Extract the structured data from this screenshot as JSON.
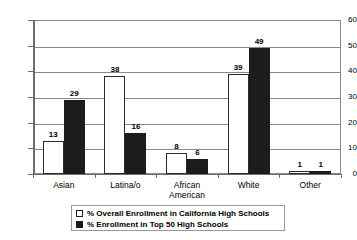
{
  "chart_data": {
    "type": "bar",
    "title": "",
    "subtitle": "",
    "xlabel": "",
    "ylabel": "",
    "ylim": [
      0,
      60
    ],
    "yticks": [
      0,
      10,
      20,
      30,
      40,
      50,
      60
    ],
    "grid": true,
    "legend_position": "bottom",
    "categories": [
      "Asian",
      "Latina/o",
      "African American",
      "White",
      "Other"
    ],
    "series": [
      {
        "name": "% Overall Enrollment in California High Schools",
        "color": "#ffffff",
        "edge_color": "#1c1c1c",
        "values": [
          13,
          38,
          8,
          39,
          1
        ]
      },
      {
        "name": "% Enrollment in Top 50 High Schools",
        "color": "#1c1c1c",
        "edge_color": "#1c1c1c",
        "values": [
          29,
          16,
          6,
          49,
          1
        ]
      }
    ]
  },
  "legend": {
    "items": [
      {
        "label": "% Overall Enrollment in California High Schools",
        "swatch": "light"
      },
      {
        "label": "% Enrollment in Top 50 High Schools",
        "swatch": "dark"
      }
    ]
  },
  "colors": {
    "background": "#ffffff",
    "axis": "#6d6d6d",
    "gridline": "#8a8a8a",
    "series_light": "#ffffff",
    "series_dark": "#1c1c1c",
    "text": "#000000"
  }
}
